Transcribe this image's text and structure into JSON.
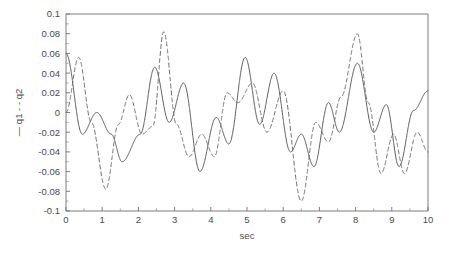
{
  "chart_data": {
    "type": "line",
    "title": "",
    "xlabel": "sec",
    "ylabel": "— q1   - - q2",
    "ylabel_parts": {
      "q1_marker": "—",
      "q1": "q1",
      "q2_marker": "- -",
      "q2": "q2"
    },
    "xlim": [
      0,
      10
    ],
    "ylim": [
      -0.1,
      0.1
    ],
    "xticks": [
      0,
      1,
      2,
      3,
      4,
      5,
      6,
      7,
      8,
      9,
      10
    ],
    "xtick_labels": [
      "0",
      "1",
      "2",
      "3",
      "4",
      "5",
      "6",
      "7",
      "8",
      "9",
      "10"
    ],
    "xminor_step": 0.5,
    "yticks": [
      -0.1,
      -0.08,
      -0.06,
      -0.04,
      -0.02,
      0,
      0.02,
      0.04,
      0.06,
      0.08,
      0.1
    ],
    "ytick_labels": [
      "-0.1",
      "-0.08",
      "-0.06",
      "-0.04",
      "-0.02",
      "0",
      "0.02",
      "0.04",
      "0.06",
      "0.08",
      "0.1"
    ],
    "grid": false,
    "legend_position": "y-axis-label",
    "colors": {
      "q1": "#5a5a5a",
      "q2": "#6e6e6e",
      "axis": "#7d7d7d",
      "text": "#4a4a4a",
      "background": "#ffffff"
    },
    "series": [
      {
        "name": "q1",
        "style": "solid",
        "model": "beat",
        "amplitude": 0.06,
        "f_fast": 1.3,
        "f_slow": 0.145,
        "phase": 0.0,
        "envelope_phase": 0.0
      },
      {
        "name": "q2",
        "style": "dashed",
        "model": "beat",
        "amplitude": 0.085,
        "f_fast": 1.3,
        "f_slow": 0.145,
        "phase": 3.14159,
        "envelope_phase": 1.5708
      }
    ],
    "q1_extrema": [
      {
        "x": 0.0,
        "y": 0.06
      },
      {
        "x": 0.45,
        "y": -0.022
      },
      {
        "x": 0.85,
        "y": 0.0
      },
      {
        "x": 1.25,
        "y": -0.022
      },
      {
        "x": 1.55,
        "y": -0.05
      },
      {
        "x": 2.05,
        "y": -0.022
      },
      {
        "x": 2.45,
        "y": 0.046
      },
      {
        "x": 2.85,
        "y": -0.01
      },
      {
        "x": 3.25,
        "y": 0.03
      },
      {
        "x": 3.7,
        "y": -0.06
      },
      {
        "x": 4.15,
        "y": -0.005
      },
      {
        "x": 4.5,
        "y": -0.032
      },
      {
        "x": 4.95,
        "y": 0.056
      },
      {
        "x": 5.35,
        "y": -0.012
      },
      {
        "x": 5.75,
        "y": 0.04
      },
      {
        "x": 6.2,
        "y": -0.04
      },
      {
        "x": 6.5,
        "y": -0.022
      },
      {
        "x": 6.85,
        "y": -0.055
      },
      {
        "x": 7.25,
        "y": 0.01
      },
      {
        "x": 7.55,
        "y": -0.02
      },
      {
        "x": 8.05,
        "y": 0.05
      },
      {
        "x": 8.5,
        "y": -0.02
      },
      {
        "x": 8.85,
        "y": 0.008
      },
      {
        "x": 9.2,
        "y": -0.055
      },
      {
        "x": 9.6,
        "y": 0.002
      },
      {
        "x": 10.0,
        "y": 0.022
      }
    ],
    "q2_extrema": [
      {
        "x": 0.0,
        "y": 0.0
      },
      {
        "x": 0.35,
        "y": 0.056
      },
      {
        "x": 0.7,
        "y": -0.01
      },
      {
        "x": 1.1,
        "y": -0.078
      },
      {
        "x": 1.45,
        "y": -0.012
      },
      {
        "x": 1.75,
        "y": 0.018
      },
      {
        "x": 2.1,
        "y": -0.022
      },
      {
        "x": 2.4,
        "y": -0.014
      },
      {
        "x": 2.7,
        "y": 0.082
      },
      {
        "x": 3.05,
        "y": -0.012
      },
      {
        "x": 3.4,
        "y": -0.045
      },
      {
        "x": 3.75,
        "y": -0.022
      },
      {
        "x": 4.1,
        "y": -0.045
      },
      {
        "x": 4.45,
        "y": 0.02
      },
      {
        "x": 4.75,
        "y": 0.01
      },
      {
        "x": 5.15,
        "y": 0.03
      },
      {
        "x": 5.55,
        "y": -0.02
      },
      {
        "x": 6.0,
        "y": 0.022
      },
      {
        "x": 6.5,
        "y": -0.09
      },
      {
        "x": 6.9,
        "y": -0.01
      },
      {
        "x": 7.25,
        "y": -0.03
      },
      {
        "x": 7.6,
        "y": 0.016
      },
      {
        "x": 8.05,
        "y": 0.08
      },
      {
        "x": 8.35,
        "y": 0.01
      },
      {
        "x": 8.7,
        "y": -0.062
      },
      {
        "x": 9.05,
        "y": -0.022
      },
      {
        "x": 9.35,
        "y": -0.062
      },
      {
        "x": 9.7,
        "y": -0.02
      },
      {
        "x": 10.0,
        "y": -0.04
      }
    ]
  },
  "axes": {
    "plot_left_px": 66,
    "plot_right_px": 428,
    "plot_top_px": 14,
    "plot_bottom_px": 211
  }
}
